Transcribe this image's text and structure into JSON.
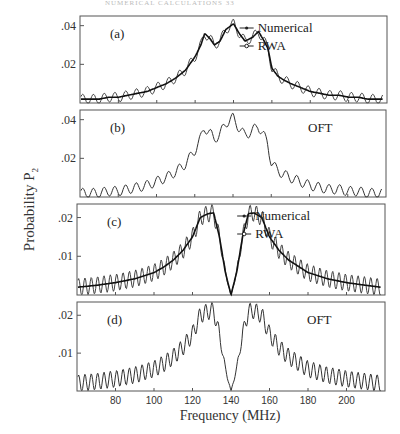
{
  "header": {
    "text": "NUMERICAL CALCULATIONS 33"
  },
  "axes": {
    "ylabel": "Probability P",
    "ylabel_sub": "2",
    "xlabel": "Frequency  (MHz)",
    "xticks": [
      80,
      100,
      120,
      140,
      160,
      180,
      200
    ],
    "xlim": [
      60,
      220
    ]
  },
  "chart_data": [
    {
      "type": "line",
      "panel": "(a)",
      "ylim": [
        0,
        0.045
      ],
      "yticks": [
        ".04",
        ".02"
      ],
      "ytick_values": [
        0.04,
        0.02
      ],
      "legend": [
        "Numerical",
        "RWA"
      ],
      "x": [
        60,
        65,
        70,
        75,
        80,
        85,
        90,
        95,
        100,
        105,
        110,
        115,
        120,
        123,
        125,
        128,
        130,
        133,
        136,
        140,
        143,
        146,
        150,
        153,
        156,
        158,
        160,
        163,
        166,
        170,
        175,
        180,
        185,
        190,
        195,
        200,
        205,
        210,
        215,
        218
      ],
      "series": [
        {
          "name": "Numerical",
          "values": [
            0.002,
            0.002,
            0.002,
            0.003,
            0.003,
            0.004,
            0.005,
            0.006,
            0.008,
            0.01,
            0.013,
            0.017,
            0.024,
            0.03,
            0.036,
            0.033,
            0.03,
            0.032,
            0.038,
            0.041,
            0.036,
            0.032,
            0.034,
            0.037,
            0.032,
            0.028,
            0.018,
            0.014,
            0.012,
            0.01,
            0.008,
            0.006,
            0.005,
            0.004,
            0.004,
            0.003,
            0.003,
            0.002,
            0.002,
            0.002
          ]
        },
        {
          "name": "RWA",
          "amplitude": 0.0025,
          "period_mhz": 5.6
        }
      ]
    },
    {
      "type": "line",
      "panel": "(b)",
      "label": "OFT",
      "ylim": [
        0,
        0.045
      ],
      "yticks": [
        ".04",
        ".02"
      ],
      "ytick_values": [
        0.04,
        0.02
      ],
      "x": [
        60,
        65,
        70,
        75,
        80,
        85,
        90,
        95,
        100,
        105,
        110,
        115,
        120,
        123,
        125,
        128,
        130,
        133,
        136,
        140,
        143,
        146,
        150,
        153,
        156,
        158,
        160,
        163,
        166,
        170,
        175,
        180,
        185,
        190,
        195,
        200,
        205,
        210,
        215,
        218
      ],
      "series": [
        {
          "name": "OFT",
          "values": [
            0.002,
            0.002,
            0.002,
            0.003,
            0.003,
            0.004,
            0.005,
            0.006,
            0.008,
            0.01,
            0.013,
            0.017,
            0.024,
            0.03,
            0.036,
            0.033,
            0.03,
            0.032,
            0.038,
            0.041,
            0.036,
            0.032,
            0.034,
            0.037,
            0.032,
            0.028,
            0.018,
            0.014,
            0.012,
            0.01,
            0.008,
            0.006,
            0.005,
            0.004,
            0.004,
            0.003,
            0.003,
            0.002,
            0.002,
            0.002
          ],
          "ripple_amplitude": 0.0025,
          "ripple_period_mhz": 5.6
        }
      ]
    },
    {
      "type": "line",
      "panel": "(c)",
      "ylim": [
        0,
        0.0235
      ],
      "yticks": [
        ".02",
        ".01"
      ],
      "ytick_values": [
        0.02,
        0.01
      ],
      "legend": [
        "Numerical",
        "RWA"
      ],
      "x": [
        60,
        70,
        80,
        90,
        100,
        105,
        110,
        115,
        120,
        124,
        128,
        131,
        134,
        137,
        140,
        143,
        146,
        149,
        152,
        156,
        160,
        165,
        170,
        180,
        190,
        200,
        210,
        218
      ],
      "series": [
        {
          "name": "Numerical",
          "values": [
            0.002,
            0.0025,
            0.0032,
            0.0042,
            0.0058,
            0.0072,
            0.009,
            0.0115,
            0.015,
            0.02,
            0.021,
            0.0212,
            0.015,
            0.006,
            0.0,
            0.006,
            0.015,
            0.021,
            0.0212,
            0.02,
            0.015,
            0.0115,
            0.009,
            0.0058,
            0.0042,
            0.0032,
            0.0025,
            0.002
          ]
        },
        {
          "name": "RWA",
          "amplitude": 0.0022,
          "period_mhz": 3.3
        }
      ]
    },
    {
      "type": "line",
      "panel": "(d)",
      "label": "OFT",
      "ylim": [
        0,
        0.0235
      ],
      "yticks": [
        ".02",
        ".01"
      ],
      "ytick_values": [
        0.02,
        0.01
      ],
      "x": [
        60,
        70,
        80,
        90,
        100,
        105,
        110,
        115,
        120,
        124,
        128,
        131,
        134,
        137,
        140,
        143,
        146,
        149,
        152,
        156,
        160,
        165,
        170,
        180,
        190,
        200,
        210,
        218
      ],
      "series": [
        {
          "name": "OFT",
          "values": [
            0.002,
            0.0025,
            0.0032,
            0.0042,
            0.0058,
            0.0072,
            0.009,
            0.0115,
            0.015,
            0.02,
            0.021,
            0.0212,
            0.015,
            0.006,
            0.0,
            0.006,
            0.015,
            0.021,
            0.0212,
            0.02,
            0.015,
            0.0115,
            0.009,
            0.0058,
            0.0042,
            0.0032,
            0.0025,
            0.002
          ],
          "ripple_amplitude": 0.0022,
          "ripple_period_mhz": 3.3
        }
      ]
    }
  ]
}
